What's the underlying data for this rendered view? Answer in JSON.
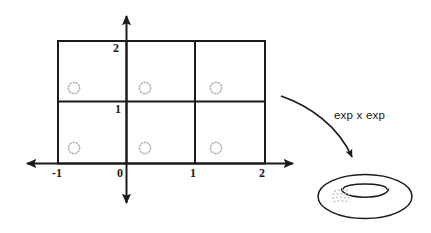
{
  "figure": {
    "title": "",
    "type": "mathematical-diagram",
    "colors": {
      "ink": "#1a1a1a",
      "grid_line": "#1a1a1a",
      "dotted_circle": "#b8b8b8",
      "background": "#ffffff"
    }
  },
  "grid": {
    "x_min": -1,
    "x_max": 2,
    "y_min": 0,
    "y_max": 2,
    "columns": 3,
    "rows": 2,
    "cell_count": 6,
    "cells": [
      {
        "row": 1,
        "col": 1,
        "x_range": [
          -1,
          0
        ],
        "y_range": [
          1,
          2
        ],
        "marker": "dotted-circle"
      },
      {
        "row": 1,
        "col": 2,
        "x_range": [
          0,
          1
        ],
        "y_range": [
          1,
          2
        ],
        "marker": "dotted-circle"
      },
      {
        "row": 1,
        "col": 3,
        "x_range": [
          1,
          2
        ],
        "y_range": [
          1,
          2
        ],
        "marker": "dotted-circle"
      },
      {
        "row": 2,
        "col": 1,
        "x_range": [
          -1,
          0
        ],
        "y_range": [
          0,
          1
        ],
        "marker": "dotted-circle"
      },
      {
        "row": 2,
        "col": 2,
        "x_range": [
          0,
          1
        ],
        "y_range": [
          0,
          1
        ],
        "marker": "dotted-circle"
      },
      {
        "row": 2,
        "col": 3,
        "x_range": [
          1,
          2
        ],
        "y_range": [
          0,
          1
        ],
        "marker": "dotted-circle"
      }
    ]
  },
  "axes": {
    "x_axis": {
      "label": "",
      "arrow_both_ends": true,
      "ticks": [
        {
          "value": "-1",
          "x": -1
        },
        {
          "value": "0",
          "x": 0
        },
        {
          "value": "1",
          "x": 1
        },
        {
          "value": "2",
          "x": 2
        }
      ]
    },
    "y_axis": {
      "label": "",
      "arrow_both_ends": true,
      "ticks": [
        {
          "value": "1",
          "y": 1
        },
        {
          "value": "2",
          "y": 2
        }
      ]
    }
  },
  "mapping": {
    "arrow_label": "exp x exp",
    "straight_arrow": "points-right",
    "curved_arrow": "curves-down-right-to-torus"
  },
  "torus": {
    "name": "torus",
    "marker": "dotted-patch",
    "outer_shape": "ellipse",
    "inner_shape": "ellipse-hole"
  }
}
